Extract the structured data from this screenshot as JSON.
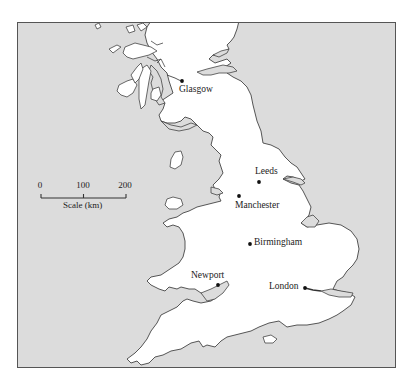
{
  "map": {
    "title": "Map of Great Britain (England, Wales and southern Scotland)",
    "colors": {
      "sea": "#dcdcdc",
      "land": "#ffffff",
      "coastline": "#444444",
      "frame": "#555555",
      "text": "#222222"
    },
    "cities": [
      {
        "name": "Glasgow",
        "x": 181,
        "y": 80
      },
      {
        "name": "Leeds",
        "x": 258,
        "y": 181
      },
      {
        "name": "Manchester",
        "x": 238,
        "y": 195
      },
      {
        "name": "Birmingham",
        "x": 249,
        "y": 243
      },
      {
        "name": "Newport",
        "x": 217,
        "y": 284
      },
      {
        "name": "London",
        "x": 304,
        "y": 287
      }
    ],
    "scale_bar": {
      "ticks": [
        "0",
        "100",
        "200"
      ],
      "caption": "Scale (km)"
    }
  }
}
